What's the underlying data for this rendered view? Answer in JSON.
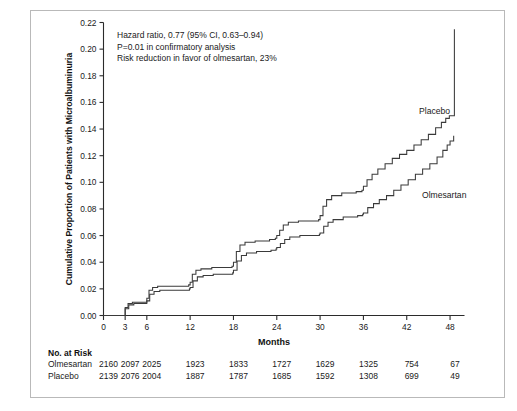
{
  "figure": {
    "annotation_lines": [
      "Hazard ratio, 0.77 (95% CI, 0.63–0.94)",
      "P=0.01 in confirmatory analysis",
      "Risk reduction in favor of olmesartan, 23%"
    ],
    "series_labels": {
      "placebo": "Placebo",
      "olmesartan": "Olmesartan"
    },
    "risk_table": {
      "heading": "No. at Risk",
      "rows": [
        {
          "name": "Olmesartan",
          "values": [
            "2160",
            "2097",
            "2025",
            "1923",
            "1833",
            "1727",
            "1629",
            "1325",
            "754",
            "67"
          ]
        },
        {
          "name": "Placebo",
          "values": [
            "2139",
            "2076",
            "2004",
            "1887",
            "1787",
            "1685",
            "1592",
            "1308",
            "699",
            "49"
          ]
        }
      ]
    }
  },
  "chart_data": {
    "type": "line",
    "title": "",
    "xlabel": "Months",
    "ylabel": "Cumulative Proportion of Patients with Microalbuminuria",
    "xlim": [
      0,
      50
    ],
    "ylim": [
      0.0,
      0.22
    ],
    "grid": false,
    "legend": "inline-curve-labels",
    "xticks": [
      0,
      3,
      6,
      12,
      18,
      24,
      30,
      36,
      42,
      48
    ],
    "xticklabels": [
      "0",
      "3",
      "6",
      "12",
      "18",
      "24",
      "30",
      "36",
      "42",
      "48"
    ],
    "yticks": [
      0.0,
      0.02,
      0.04,
      0.06,
      0.08,
      0.1,
      0.12,
      0.14,
      0.16,
      0.18,
      0.2,
      0.22
    ],
    "yticklabels": [
      "0.00",
      "0.02",
      "0.04",
      "0.06",
      "0.08",
      "0.10",
      "0.12",
      "0.14",
      "0.16",
      "0.18",
      "0.20",
      "0.22"
    ],
    "series": [
      {
        "name": "Placebo",
        "step": "post",
        "x": [
          0,
          2.6,
          3.0,
          3.4,
          4.0,
          5.0,
          5.8,
          6.0,
          6.3,
          6.8,
          7.5,
          9.0,
          11.0,
          11.8,
          12.0,
          12.3,
          12.8,
          13.5,
          15.0,
          17.0,
          17.8,
          18.0,
          18.4,
          18.9,
          19.6,
          21.0,
          23.0,
          23.8,
          24.0,
          24.4,
          24.9,
          25.6,
          27.0,
          29.0,
          29.8,
          30.0,
          30.4,
          30.9,
          31.6,
          33.0,
          35.0,
          35.8,
          36.0,
          36.5,
          37.2,
          38.0,
          39.0,
          40.0,
          41.0,
          42.0,
          43.0,
          44.0,
          45.0,
          46.0,
          46.8,
          47.4,
          47.9,
          48.3,
          48.6
        ],
        "y": [
          0.0,
          0.0,
          0.006,
          0.009,
          0.01,
          0.01,
          0.01,
          0.013,
          0.019,
          0.021,
          0.022,
          0.022,
          0.022,
          0.023,
          0.025,
          0.031,
          0.034,
          0.035,
          0.036,
          0.036,
          0.037,
          0.04,
          0.048,
          0.053,
          0.055,
          0.056,
          0.057,
          0.058,
          0.06,
          0.064,
          0.068,
          0.07,
          0.071,
          0.071,
          0.072,
          0.075,
          0.082,
          0.087,
          0.09,
          0.092,
          0.093,
          0.094,
          0.097,
          0.102,
          0.106,
          0.11,
          0.114,
          0.118,
          0.121,
          0.124,
          0.128,
          0.132,
          0.136,
          0.141,
          0.145,
          0.148,
          0.15,
          0.15,
          0.215
        ]
      },
      {
        "name": "Olmesartan",
        "step": "post",
        "x": [
          0,
          2.6,
          3.0,
          3.5,
          4.2,
          5.2,
          5.9,
          6.0,
          6.4,
          7.0,
          7.8,
          9.2,
          11.2,
          11.9,
          12.0,
          12.4,
          13.0,
          13.8,
          15.2,
          17.2,
          17.9,
          18.0,
          18.5,
          19.1,
          19.8,
          21.2,
          23.2,
          23.9,
          24.0,
          24.5,
          25.1,
          25.8,
          27.2,
          29.2,
          29.9,
          30.0,
          30.5,
          31.1,
          31.8,
          33.2,
          35.2,
          35.9,
          36.0,
          36.6,
          37.4,
          38.2,
          39.2,
          40.2,
          41.2,
          42.2,
          43.2,
          44.2,
          45.2,
          46.2,
          47.0,
          47.6,
          48.0,
          48.5
        ],
        "y": [
          0.0,
          0.0,
          0.005,
          0.008,
          0.009,
          0.009,
          0.009,
          0.011,
          0.016,
          0.018,
          0.019,
          0.019,
          0.019,
          0.02,
          0.021,
          0.026,
          0.029,
          0.03,
          0.031,
          0.031,
          0.032,
          0.034,
          0.041,
          0.045,
          0.047,
          0.048,
          0.049,
          0.05,
          0.051,
          0.054,
          0.057,
          0.059,
          0.06,
          0.06,
          0.061,
          0.062,
          0.067,
          0.07,
          0.072,
          0.074,
          0.075,
          0.076,
          0.077,
          0.081,
          0.084,
          0.087,
          0.09,
          0.094,
          0.098,
          0.102,
          0.106,
          0.11,
          0.114,
          0.119,
          0.124,
          0.128,
          0.131,
          0.135
        ]
      }
    ],
    "annotations": [
      "Hazard ratio, 0.77 (95% CI, 0.63–0.94)",
      "P=0.01 in confirmatory analysis",
      "Risk reduction in favor of olmesartan, 23%"
    ]
  }
}
